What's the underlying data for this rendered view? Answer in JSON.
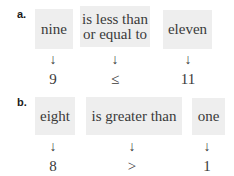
{
  "examples": [
    {
      "label": "a.",
      "words": [
        "nine",
        "is less than or equal to",
        "eleven"
      ],
      "word_lines": [
        [
          "nine"
        ],
        [
          "is less than",
          "or equal to"
        ],
        [
          "eleven"
        ]
      ],
      "arrow": "↓",
      "symbols": [
        "9",
        "≤",
        "11"
      ]
    },
    {
      "label": "b.",
      "words": [
        "eight",
        "is greater than",
        "one"
      ],
      "word_lines": [
        [
          "eight"
        ],
        [
          "is greater than"
        ],
        [
          "one"
        ]
      ],
      "arrow": "↓",
      "symbols": [
        "8",
        ">",
        "1"
      ]
    }
  ],
  "colors": {
    "box_bg": "#eeeeee",
    "text": "#3a3a3a"
  }
}
